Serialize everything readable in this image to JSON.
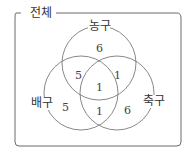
{
  "universe": {
    "label": "전체"
  },
  "sets": [
    {
      "name": "농구",
      "cx": 99,
      "cy": 63,
      "r": 37
    },
    {
      "name": "배구",
      "cx": 81,
      "cy": 93,
      "r": 37
    },
    {
      "name": "축구",
      "cx": 117,
      "cy": 93,
      "r": 37
    }
  ],
  "regions": {
    "basketball_only": "6",
    "basketball_volleyball": "5",
    "basketball_soccer": "1",
    "all_three": "1",
    "volleyball_only": "5",
    "volleyball_soccer": "1",
    "soccer_only": "6"
  },
  "colors": {
    "stroke": "#6b6b6b",
    "text": "#333333"
  }
}
